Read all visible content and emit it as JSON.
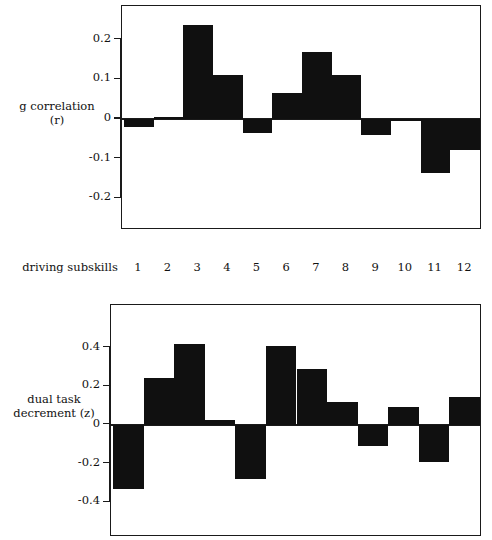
{
  "figure": {
    "background": "#ffffff",
    "ink": "#101010"
  },
  "category_axis": {
    "title": "driving subskills",
    "labels": [
      "1",
      "2",
      "3",
      "4",
      "5",
      "6",
      "7",
      "8",
      "9",
      "10",
      "11",
      "12"
    ]
  },
  "panels": {
    "top": {
      "ylabel_line1": "g correlation",
      "ylabel_line2": "(r)",
      "ytick_labels": [
        "0.2",
        "0.1",
        "0",
        "-0.1",
        "-0.2"
      ]
    },
    "bottom": {
      "ylabel_line1": "dual task",
      "ylabel_line2": "decrement (z)",
      "ytick_labels": [
        "0.4",
        "0.2",
        "0",
        "-0.2",
        "-0.4"
      ]
    }
  },
  "chart_data": [
    {
      "type": "bar",
      "title": "",
      "xlabel": "driving subskills",
      "ylabel": "g correlation (r)",
      "categories": [
        "1",
        "2",
        "3",
        "4",
        "5",
        "6",
        "7",
        "8",
        "9",
        "10",
        "11",
        "12"
      ],
      "values": [
        -0.02,
        0.006,
        0.237,
        0.11,
        -0.036,
        0.066,
        0.168,
        0.112,
        -0.04,
        -0.005,
        -0.136,
        -0.077
      ],
      "yticks": [
        0.2,
        0.1,
        0,
        -0.1,
        -0.2
      ],
      "ylim": [
        -0.28,
        0.285
      ],
      "grid": false,
      "legend": null,
      "bar_gap": 0,
      "bar_color": "#101010"
    },
    {
      "type": "bar",
      "title": "",
      "xlabel": "driving subskills",
      "ylabel": "dual task decrement (z)",
      "categories": [
        "1",
        "2",
        "3",
        "4",
        "5",
        "6",
        "7",
        "8",
        "9",
        "10",
        "11",
        "12"
      ],
      "values": [
        -0.33,
        0.245,
        0.42,
        0.025,
        -0.28,
        0.41,
        0.29,
        0.12,
        -0.11,
        0.095,
        -0.19,
        0.145
      ],
      "yticks": [
        0.4,
        0.2,
        0,
        -0.2,
        -0.4
      ],
      "ylim": [
        -0.58,
        0.62
      ],
      "grid": false,
      "legend": null,
      "bar_gap": 0,
      "bar_color": "#101010"
    }
  ]
}
